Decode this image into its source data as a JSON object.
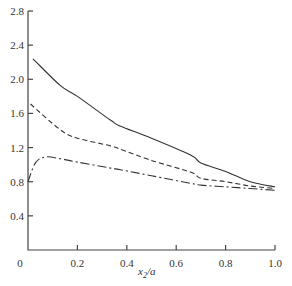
{
  "chart_data": {
    "type": "line",
    "title": "",
    "xlabel": "x2/a",
    "ylabel": "",
    "xlim": [
      0,
      1.0
    ],
    "ylim": [
      0,
      2.8
    ],
    "grid": false,
    "legend": null,
    "x_ticks": [
      "0",
      "0.2",
      "0.4",
      "0.6",
      "0.8",
      "1.0"
    ],
    "y_ticks": [
      "0.4",
      "0.8",
      "1.2",
      "1.6",
      "2.0",
      "2.4",
      "2.8"
    ],
    "series": [
      {
        "name": "solid",
        "style": "solid",
        "x": [
          0.02,
          0.13,
          0.2,
          0.335,
          0.375,
          0.5,
          0.66,
          0.7,
          0.8,
          0.9,
          1.0
        ],
        "values": [
          2.24,
          1.93,
          1.8,
          1.52,
          1.45,
          1.31,
          1.11,
          1.02,
          0.92,
          0.8,
          0.74
        ]
      },
      {
        "name": "dashed",
        "style": "dashed",
        "x": [
          0.01,
          0.13,
          0.2,
          0.335,
          0.375,
          0.5,
          0.66,
          0.7,
          0.8,
          0.9,
          1.0
        ],
        "values": [
          1.71,
          1.41,
          1.31,
          1.22,
          1.18,
          1.05,
          0.91,
          0.84,
          0.8,
          0.75,
          0.72
        ]
      },
      {
        "name": "dash-dot",
        "style": "dash-dot",
        "x": [
          0.0,
          0.03,
          0.07,
          0.13,
          0.2,
          0.335,
          0.375,
          0.5,
          0.66,
          0.7,
          0.8,
          0.9,
          1.0
        ],
        "values": [
          0.8,
          1.02,
          1.09,
          1.07,
          1.03,
          0.96,
          0.94,
          0.87,
          0.78,
          0.76,
          0.74,
          0.72,
          0.7
        ]
      }
    ]
  },
  "labels": {
    "xlabel_main": "x",
    "xlabel_sub": "2",
    "xlabel_tail": "/a"
  }
}
